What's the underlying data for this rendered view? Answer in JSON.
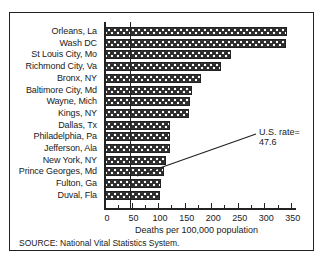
{
  "chart_data": {
    "type": "bar",
    "orientation": "horizontal",
    "title": "",
    "xlabel": "Deaths per 100,000 population",
    "ylabel": "",
    "xlim": [
      0,
      350
    ],
    "xticks": [
      0,
      50,
      100,
      150,
      200,
      250,
      300,
      350
    ],
    "xtick_labels": [
      "0",
      "50",
      "100",
      "150",
      "200",
      "250",
      "300",
      "350"
    ],
    "grid": false,
    "legend": null,
    "categories": [
      "Orleans, La",
      "Wash DC",
      "St Louis City, Mo",
      "Richmond City, Va",
      "Bronx, NY",
      "Baltimore City, Md",
      "Wayne, Mich",
      "Kings, NY",
      "Dallas, Tx",
      "Philadelphia, Pa",
      "Jefferson, Ala",
      "New York, NY",
      "Prince Georges, Md",
      "Fulton, Ga",
      "Duval, Fla"
    ],
    "values": [
      343,
      340,
      237,
      218,
      181,
      164,
      161,
      158,
      122,
      122,
      122,
      115,
      111,
      106,
      103
    ],
    "reference_line": {
      "value": 47.6,
      "label": "U.S. rate= 47.6"
    },
    "annotations": [
      {
        "text_line1": "U.S. rate=",
        "text_line2": "47.6"
      }
    ],
    "source": "SOURCE: National Vital Statistics System."
  },
  "colors": {
    "bar_fill": "#2a2a2a",
    "bar_pattern_dot": "#ffffff",
    "axis": "#222222",
    "background": "#ffffff"
  }
}
